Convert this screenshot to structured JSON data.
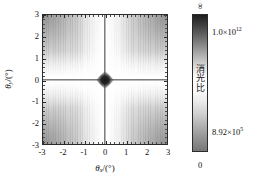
{
  "chart_data": {
    "type": "heatmap",
    "title": "",
    "xlabel": "θx/(°)",
    "ylabel": "θy/(°)",
    "xlabel_symbol": "θ",
    "xlabel_subscript": "x",
    "xlabel_unit": "/(°)",
    "ylabel_symbol": "θ",
    "ylabel_subscript": "y",
    "ylabel_unit": "/(°)",
    "xlim": [
      -3,
      3
    ],
    "ylim": [
      -3,
      3
    ],
    "xticks": [
      -3,
      -2,
      -1,
      0,
      1,
      2,
      3
    ],
    "yticks": [
      -3,
      -2,
      -1,
      0,
      1,
      2,
      3
    ],
    "xtick_labels": [
      "-3",
      "-2",
      "-1",
      "0",
      "1",
      "2",
      "3"
    ],
    "ytick_labels": [
      "-3",
      "-2",
      "-1",
      "0",
      "1",
      "2",
      "3"
    ],
    "grid": false,
    "colormap": "grayscale-inverted",
    "zvalues_note": "white = high extinction ratio (~1.0x10^12), gray = low (~8.92x10^5), black = infinite",
    "features": [
      {
        "name": "singular-cross-vertical",
        "at_x": 0,
        "description": "dark vertical line at theta_x = 0 where extinction ratio is infinite"
      },
      {
        "name": "singular-cross-horizontal",
        "at_y": 0,
        "description": "dark horizontal line at theta_y = 0 where extinction ratio is infinite"
      },
      {
        "name": "origin-singularity",
        "at_x": 0,
        "at_y": 0,
        "description": "dark diamond spot at the origin"
      }
    ],
    "colorbar": {
      "position": "right",
      "label": "消光比",
      "top_label": "∞",
      "bottom_label": "0",
      "tick_labels": [
        {
          "text_mantissa": "1.0×10",
          "exponent": "12",
          "full": "1.0×10¹²",
          "position_frac": 0.13
        },
        {
          "text_mantissa": "8.92×10",
          "exponent": "5",
          "full": "8.92×10⁵",
          "position_frac": 0.855
        }
      ],
      "gradient_top_color": "#1e1e1e",
      "gradient_mid_color": "#ffffff",
      "gradient_bottom_color": "#777777"
    }
  },
  "axes": {
    "x": {
      "title_symbol": "θ",
      "title_sub": "x",
      "title_unit": "/(°)",
      "ticks": [
        {
          "label": "-3",
          "value": -3
        },
        {
          "label": "-2",
          "value": -2
        },
        {
          "label": "-1",
          "value": -1
        },
        {
          "label": "0",
          "value": 0
        },
        {
          "label": "1",
          "value": 1
        },
        {
          "label": "2",
          "value": 2
        },
        {
          "label": "3",
          "value": 3
        }
      ]
    },
    "y": {
      "title_symbol": "θ",
      "title_sub": "y",
      "title_unit": "/(°)",
      "ticks": [
        {
          "label": "3",
          "value": 3
        },
        {
          "label": "2",
          "value": 2
        },
        {
          "label": "1",
          "value": 1
        },
        {
          "label": "0",
          "value": 0
        },
        {
          "label": "-1",
          "value": -1
        },
        {
          "label": "-2",
          "value": -2
        },
        {
          "label": "-3",
          "value": -3
        }
      ]
    }
  },
  "colorbar_ui": {
    "top": "∞",
    "bottom": "0",
    "upper_value_mantissa": "1.0×10",
    "upper_value_exponent": "12",
    "lower_value_mantissa": "8.92×10",
    "lower_value_exponent": "5",
    "vertical_label": "消光比"
  },
  "colors": {
    "axis_line": "#2b2b2b",
    "text": "#111111",
    "singularity": "#3a3a3a",
    "background": "#ffffff"
  }
}
